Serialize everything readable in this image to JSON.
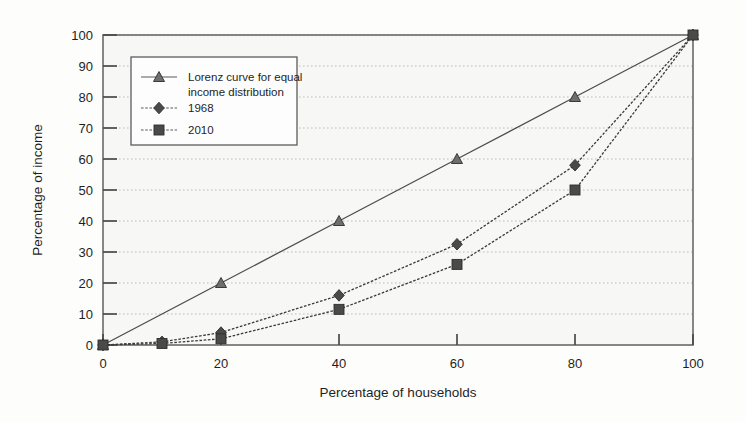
{
  "chart_data": {
    "type": "line",
    "title": "",
    "subtitle": "",
    "xlabel": "Percentage of households",
    "ylabel": "Percentage of income",
    "xlim": [
      0,
      100
    ],
    "ylim": [
      0,
      100
    ],
    "xticks": [
      0,
      20,
      40,
      60,
      80,
      100
    ],
    "yticks": [
      0,
      10,
      20,
      30,
      40,
      50,
      60,
      70,
      80,
      90,
      100
    ],
    "xtick_labels": [
      "0",
      "20",
      "40",
      "60",
      "80",
      "100"
    ],
    "ytick_labels": [
      "0",
      "10",
      "20",
      "30",
      "40",
      "50",
      "60",
      "70",
      "80",
      "90",
      "100"
    ],
    "grid": "horizontal-dotted",
    "legend_position": "upper-left-inside",
    "series": [
      {
        "name": "Lorenz curve for equal income distribution",
        "marker": "triangle",
        "color": "#4d4d4d",
        "x": [
          0,
          20,
          40,
          60,
          80,
          100
        ],
        "values": [
          0,
          20,
          40,
          60,
          80,
          100
        ]
      },
      {
        "name": "1968",
        "marker": "diamond",
        "color": "#3a3a3a",
        "x": [
          0,
          10,
          20,
          40,
          60,
          80,
          100
        ],
        "values": [
          0,
          1,
          4,
          16,
          32.5,
          58,
          100
        ]
      },
      {
        "name": "2010",
        "marker": "square",
        "color": "#3a3a3a",
        "x": [
          0,
          10,
          20,
          40,
          60,
          80,
          100
        ],
        "values": [
          0,
          0.5,
          2,
          11.5,
          26,
          50,
          100
        ]
      }
    ]
  },
  "axes": {
    "x_title": "Percentage of households",
    "y_title": "Percentage of income"
  },
  "legend": {
    "entries": [
      {
        "label_line1": "Lorenz curve for equal",
        "label_line2": "income distribution",
        "marker": "triangle"
      },
      {
        "label_line1": "1968",
        "label_line2": "",
        "marker": "diamond"
      },
      {
        "label_line1": "2010",
        "label_line2": "",
        "marker": "square"
      }
    ]
  },
  "colors": {
    "plot_background": "#f7f7f5",
    "frame": "#5a5a5a",
    "gridline": "#b9b9b9",
    "series_ink": "#3a3a3a",
    "text": "#1f1f1f"
  }
}
